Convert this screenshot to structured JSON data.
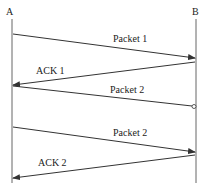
{
  "diagram": {
    "type": "sequence-diagram",
    "lifelines": [
      {
        "id": "A",
        "label": "A"
      },
      {
        "id": "B",
        "label": "B"
      }
    ],
    "messages": [
      {
        "label": "Packet 1",
        "from": "A",
        "to": "B",
        "status": "delivered"
      },
      {
        "label": "ACK 1",
        "from": "B",
        "to": "A",
        "status": "delivered"
      },
      {
        "label": "Packet 2",
        "from": "A",
        "to": "B",
        "status": "lost"
      },
      {
        "label": "Packet 2",
        "from": "A",
        "to": "B",
        "status": "delivered"
      },
      {
        "label": "ACK 2",
        "from": "B",
        "to": "A",
        "status": "delivered"
      }
    ],
    "colors": {
      "line": "#333333",
      "background": "#ffffff"
    }
  }
}
